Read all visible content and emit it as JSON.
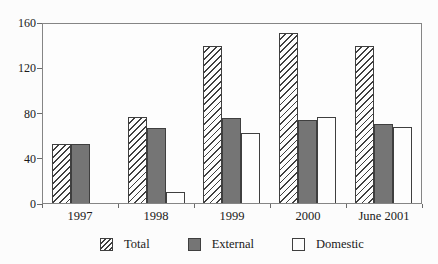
{
  "chart_data": {
    "type": "bar",
    "categories": [
      "1997",
      "1998",
      "1999",
      "2000",
      "June 2001"
    ],
    "series": [
      {
        "name": "Total",
        "style": "hatch",
        "values": [
          53,
          77,
          140,
          152,
          140
        ]
      },
      {
        "name": "External",
        "style": "solid",
        "values": [
          53,
          67,
          76,
          74,
          71
        ]
      },
      {
        "name": "Domestic",
        "style": "white",
        "values": [
          0,
          10,
          63,
          77,
          68
        ]
      }
    ],
    "title": "",
    "xlabel": "",
    "ylabel": "",
    "ylim": [
      0,
      160
    ],
    "yticks": [
      0,
      40,
      80,
      120,
      160
    ],
    "grid": false,
    "legend_position": "bottom"
  },
  "legend": {
    "items": [
      {
        "label": "Total"
      },
      {
        "label": "External"
      },
      {
        "label": "Domestic"
      }
    ]
  },
  "colors": {
    "external_fill": "#757575",
    "bar_border": "#3f3f3f",
    "frame": "#858585",
    "background": "#fcfcfc"
  }
}
